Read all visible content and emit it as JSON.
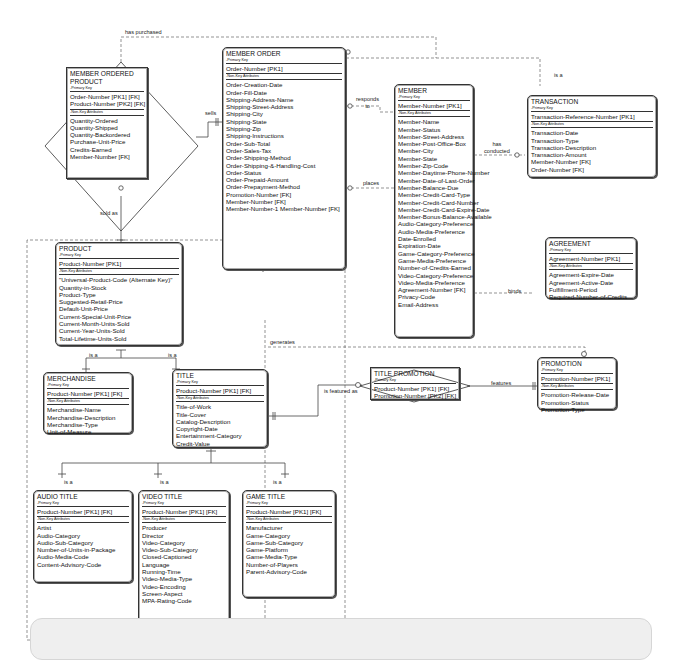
{
  "diagram": {
    "entities": {
      "member_ordered_product": {
        "name": "MEMBER ORDERED PRODUCT",
        "pk_label": "-Primary Key",
        "pk": [
          "Order-Number  [PK1] [FK]",
          "Product-Number  [PK2] [FK]"
        ],
        "nk_label": "-Non-Key Attributes",
        "attrs": [
          "Quantity-Ordered",
          "Quantity-Shipped",
          "Quantity-Backordered",
          "Purchase-Unit-Price",
          "Credits-Earned",
          "Member-Number  [FK]"
        ]
      },
      "member_order": {
        "name": "MEMBER ORDER",
        "pk_label": "-Primary Key",
        "pk": [
          "Order-Number  [PK1]"
        ],
        "nk_label": "-Non-Key Attributes",
        "attrs": [
          "Order-Creation-Date",
          "Order-Fill-Date",
          "Shipping-Address-Name",
          "Shipping-Street-Address",
          "Shipping-City",
          "Shipping-State",
          "Shipping-Zip",
          "Shipping-Instructions",
          "Order-Sub-Total",
          "Order-Sales-Tax",
          "Order-Shipping-Method",
          "Order-Shipping-&-Handling-Cost",
          "Order-Status",
          "Order-Prepaid-Amount",
          "Order-Prepayment-Method",
          "Promotion-Number  [FK]",
          "Member-Number  [FK]",
          "Member-Number-1      Member-Number  [FK]"
        ]
      },
      "member": {
        "name": "MEMBER",
        "pk_label": "-Primary Key",
        "pk": [
          "Member-Number  [PK1]"
        ],
        "nk_label": "-Non-Key Attributes",
        "attrs": [
          "Member-Name",
          "Member-Status",
          "Member-Street-Address",
          "Member-Post-Office-Box",
          "Member-City",
          "Member-State",
          "Member-Zip-Code",
          "Member-Daytime-Phone-Number",
          "Member-Date-of-Last-Order",
          "Member-Balance-Due",
          "Member-Credit-Card-Type",
          "Member-Credit-Card-Number",
          "Member-Credit-Card-Expire-Date",
          "Member-Bonus-Balance-Available",
          "Audio-Category-Preference",
          "Audio-Media-Preference",
          "Date-Enrolled",
          "Expiration-Date",
          "Game-Category-Preference",
          "Game-Media-Preference",
          "Number-of-Credits-Earned",
          "Video-Category-Preference",
          "Video-Media-Preference",
          "Agreement-Number  [FK]",
          "Privacy-Code",
          "Email-Address"
        ]
      },
      "transaction": {
        "name": "TRANSACTION",
        "pk_label": "-Primary Key",
        "pk": [
          "Transaction-Reference-Number  [PK1]"
        ],
        "nk_label": "-Non-Key Attributes",
        "attrs": [
          "Transaction-Date",
          "Transaction-Type",
          "Transaction-Description",
          "Transaction-Amount",
          "Member-Number  [FK]",
          "Order-Number  [FK]"
        ]
      },
      "agreement": {
        "name": "AGREEMENT",
        "pk_label": "-Primary Key",
        "pk": [
          "Agreement-Number  [PK1]"
        ],
        "nk_label": "-Non-Key Attributes",
        "attrs": [
          "Agreement-Expire-Date",
          "Agreement-Active-Date",
          "Fulfillment-Period",
          "Required-Number-of-Credits"
        ]
      },
      "product": {
        "name": "PRODUCT",
        "pk_label": "-Primary Key",
        "pk": [
          "Product-Number  [PK1]"
        ],
        "nk_label": "-Non-Key Attributes",
        "attrs": [
          "\"Universal-Product-Code (Alternate Key)\"",
          "Quantity-in-Stock",
          "Product-Type",
          "Suggested-Retail-Price",
          "Default-Unit-Price",
          "Current-Special-Unit-Price",
          "Current-Month-Units-Sold",
          "Current-Year-Units-Sold",
          "Total-Lifetime-Units-Sold"
        ]
      },
      "merchandise": {
        "name": "MERCHANDISE",
        "pk_label": "-Primary Key",
        "pk": [
          "Product-Number  [PK1] [FK]"
        ],
        "nk_label": "-Non-Key Attributes",
        "attrs": [
          "Merchandise-Name",
          "Merchandise-Description",
          "Merchandise-Type",
          "Unit-of-Measure"
        ]
      },
      "title": {
        "name": "TITLE",
        "pk_label": "-Primary Key",
        "pk": [
          "Product-Number  [PK1] [FK]"
        ],
        "nk_label": "-Non-Key Attributes",
        "attrs": [
          "Title-of-Work",
          "Title-Cover",
          "Catalog-Description",
          "Copyright-Date",
          "Entertainment-Category",
          "Credit-Value"
        ]
      },
      "title_promotion": {
        "name": "TITLE PROMOTION",
        "pk_label": "-Primary Key",
        "pk": [
          "Product-Number  [PK1] [FK]",
          "Promotion-Number  [PK2] [FK]"
        ],
        "nk_label": "",
        "attrs": []
      },
      "promotion": {
        "name": "PROMOTION",
        "pk_label": "-Primary Key",
        "pk": [
          "Promotion-Number  [PK1]"
        ],
        "nk_label": "-Non-Key Attributes",
        "attrs": [
          "Promotion-Release-Date",
          "Promotion-Status",
          "Promotion-Type"
        ]
      },
      "audio_title": {
        "name": "AUDIO TITLE",
        "pk_label": "-Primary Key",
        "pk": [
          "Product-Number  [PK1] [FK]"
        ],
        "nk_label": "-Non-Key Attributes",
        "attrs": [
          "Artist",
          "Audio-Category",
          "Audio-Sub-Category",
          "Number-of-Units-in-Package",
          "Audio-Media-Code",
          "Content-Advisory-Code"
        ]
      },
      "video_title": {
        "name": "VIDEO TITLE",
        "pk_label": "-Primary Key",
        "pk": [
          "Product-Number  [PK1] [FK]"
        ],
        "nk_label": "-Non-Key Attributes",
        "attrs": [
          "Producer",
          "Director",
          "Video-Category",
          "Video-Sub-Category",
          "Closed-Captioned",
          "Language",
          "Running-Time",
          "Video-Media-Type",
          "Video-Encoding",
          "Screen-Aspect",
          "MPA-Rating-Code"
        ]
      },
      "game_title": {
        "name": "GAME TITLE",
        "pk_label": "-Primary Key",
        "pk": [
          "Product-Number  [PK1] [FK]"
        ],
        "nk_label": "-Non-Key Attributes",
        "attrs": [
          "Manufacturer",
          "Game-Category",
          "Game-Sub-Category",
          "Game-Platform",
          "Game-Media-Type",
          "Number-of-Players",
          "Parent-Advisory-Code"
        ]
      }
    },
    "relationships": {
      "has_purchased": "has purchased",
      "sells": "sells",
      "sold_as": "sold as",
      "responds_to": "responds\nto",
      "places": "places",
      "has_conducted": "has\nconducted",
      "is_a_transaction": "is a",
      "binds": "binds",
      "generates": "generates",
      "is_a_merch": "is a",
      "is_a_title": "is a",
      "is_featured_as": "is featured as",
      "features": "features",
      "is_a_audio": "is a",
      "is_a_video": "is a",
      "is_a_game": "is a"
    }
  }
}
